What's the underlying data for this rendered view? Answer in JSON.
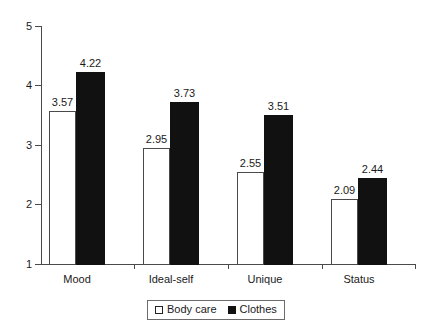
{
  "chart_data": {
    "type": "bar",
    "title": "",
    "subtitle": "",
    "xlabel": "",
    "ylabel": "",
    "categories": [
      "Mood",
      "Ideal-self",
      "Unique",
      "Status"
    ],
    "series": [
      {
        "name": "Body care",
        "values": [
          3.57,
          2.95,
          2.55,
          2.09
        ],
        "color": "#ffffff",
        "edge_color": "#4a4a4a"
      },
      {
        "name": "Clothes",
        "values": [
          4.22,
          3.73,
          3.51,
          2.44
        ],
        "color": "#111111",
        "edge_color": "#111111"
      }
    ],
    "value_labels": [
      [
        "3.57",
        "2.95",
        "2.55",
        "2.09"
      ],
      [
        "4.22",
        "3.73",
        "3.51",
        "2.44"
      ]
    ],
    "ylim": [
      1,
      5
    ],
    "yticks": [
      1,
      2,
      3,
      4,
      5
    ],
    "ytick_labels": [
      "1",
      "2",
      "3",
      "4",
      "5"
    ],
    "grid": false,
    "legend_position": "bottom-center",
    "legend_entries": [
      "Body care",
      "Clothes"
    ]
  },
  "axis": {
    "y_labels": [
      "5",
      "4",
      "3",
      "2",
      "1"
    ]
  },
  "legend": {
    "items": [
      {
        "label": "Body care",
        "swatch": "open-square-swatch"
      },
      {
        "label": "Clothes",
        "swatch": "filled-square-swatch"
      }
    ]
  }
}
